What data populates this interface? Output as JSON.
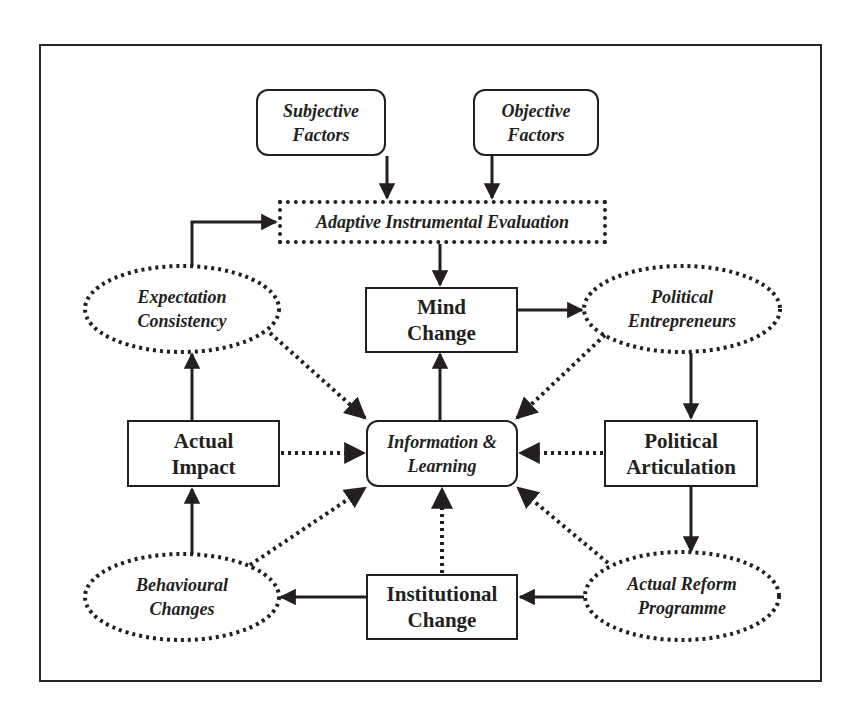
{
  "diagram": {
    "nodes": {
      "subjective_factors": {
        "label": "Subjective\nFactors",
        "shape": "rounded-rect",
        "style": "italic"
      },
      "objective_factors": {
        "label": "Objective\nFactors",
        "shape": "rounded-rect",
        "style": "italic"
      },
      "adaptive_evaluation": {
        "label": "Adaptive Instrumental Evaluation",
        "shape": "dotted-rect",
        "style": "italic"
      },
      "expectation_consistency": {
        "label": "Expectation\nConsistency",
        "shape": "dotted-ellipse",
        "style": "italic"
      },
      "mind_change": {
        "label": "Mind\nChange",
        "shape": "rect",
        "style": "bold"
      },
      "political_entrepreneurs": {
        "label": "Political\nEntrepreneurs",
        "shape": "dotted-ellipse",
        "style": "italic"
      },
      "actual_impact": {
        "label": "Actual\nImpact",
        "shape": "rect",
        "style": "bold"
      },
      "information_learning": {
        "label": "Information &\nLearning",
        "shape": "rounded-rect",
        "style": "italic"
      },
      "political_articulation": {
        "label": "Political\nArticulation",
        "shape": "rect",
        "style": "bold"
      },
      "behavioural_changes": {
        "label": "Behavioural\nChanges",
        "shape": "dotted-ellipse",
        "style": "italic"
      },
      "institutional_change": {
        "label": "Institutional\nChange",
        "shape": "rect",
        "style": "bold"
      },
      "actual_reform_programme": {
        "label": "Actual Reform\nProgramme",
        "shape": "dotted-ellipse",
        "style": "italic"
      }
    },
    "edges": [
      {
        "from": "Subjective Factors",
        "to": "Adaptive Instrumental Evaluation",
        "style": "solid"
      },
      {
        "from": "Objective Factors",
        "to": "Adaptive Instrumental Evaluation",
        "style": "solid"
      },
      {
        "from": "Adaptive Instrumental Evaluation",
        "to": "Mind Change",
        "style": "solid"
      },
      {
        "from": "Mind Change",
        "to": "Political Entrepreneurs",
        "style": "solid"
      },
      {
        "from": "Political Entrepreneurs",
        "to": "Political Articulation",
        "style": "solid"
      },
      {
        "from": "Political Articulation",
        "to": "Actual Reform Programme",
        "style": "solid"
      },
      {
        "from": "Actual Reform Programme",
        "to": "Institutional Change",
        "style": "solid"
      },
      {
        "from": "Institutional Change",
        "to": "Behavioural Changes",
        "style": "solid"
      },
      {
        "from": "Behavioural Changes",
        "to": "Actual Impact",
        "style": "solid"
      },
      {
        "from": "Actual Impact",
        "to": "Expectation Consistency",
        "style": "solid"
      },
      {
        "from": "Expectation Consistency",
        "to": "Adaptive Instrumental Evaluation",
        "style": "solid"
      },
      {
        "from": "Information & Learning",
        "to": "Mind Change",
        "style": "solid"
      },
      {
        "from": "Expectation Consistency",
        "to": "Information & Learning",
        "style": "dotted"
      },
      {
        "from": "Political Entrepreneurs",
        "to": "Information & Learning",
        "style": "dotted"
      },
      {
        "from": "Actual Impact",
        "to": "Information & Learning",
        "style": "dotted"
      },
      {
        "from": "Political Articulation",
        "to": "Information & Learning",
        "style": "dotted"
      },
      {
        "from": "Behavioural Changes",
        "to": "Information & Learning",
        "style": "dotted"
      },
      {
        "from": "Institutional Change",
        "to": "Information & Learning",
        "style": "dotted"
      },
      {
        "from": "Actual Reform Programme",
        "to": "Information & Learning",
        "style": "dotted"
      }
    ],
    "colors": {
      "ink": "#231f20",
      "background": "#ffffff"
    }
  }
}
